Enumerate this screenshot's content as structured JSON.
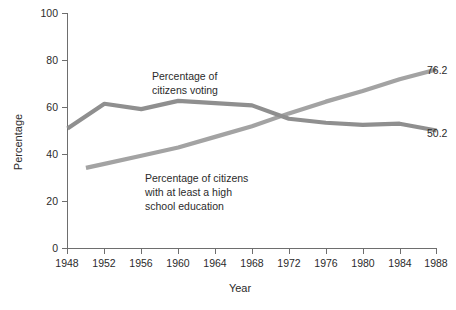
{
  "chart_data": {
    "type": "line",
    "title": "",
    "xlabel": "Year",
    "ylabel": "Percentage",
    "xlim": [
      1948,
      1988
    ],
    "ylim": [
      0,
      100
    ],
    "grid": false,
    "legend_position": "inline-annotations",
    "x_ticks": [
      "1948",
      "1952",
      "1956",
      "1960",
      "1964",
      "1968",
      "1972",
      "1976",
      "1980",
      "1984",
      "1988"
    ],
    "y_ticks": [
      "0",
      "20",
      "40",
      "60",
      "80",
      "100"
    ],
    "series": [
      {
        "name": "Percentage of citizens voting",
        "color": "#8f8f8f",
        "x": [
          1948,
          1952,
          1956,
          1960,
          1964,
          1968,
          1972,
          1976,
          1980,
          1984,
          1988
        ],
        "values": [
          51.1,
          61.6,
          59.3,
          62.8,
          61.9,
          60.9,
          55.2,
          53.5,
          52.6,
          53.1,
          50.2
        ],
        "end_label": "50.2"
      },
      {
        "name": "Percentage of citizens with at least a high school education",
        "color": "#a3a3a3",
        "x": [
          1950,
          1952,
          1956,
          1960,
          1964,
          1968,
          1972,
          1976,
          1980,
          1984,
          1988
        ],
        "values": [
          34.3,
          36.0,
          39.5,
          43.0,
          47.5,
          52.0,
          57.5,
          62.5,
          67.0,
          72.0,
          76.2
        ],
        "end_label": "76.2"
      }
    ],
    "annotations": [
      {
        "name": "voting-annotation",
        "lines": [
          "Percentage of",
          "citizens voting"
        ],
        "x": 152,
        "y": 80
      },
      {
        "name": "education-annotation",
        "lines": [
          "Percentage of citizens",
          "with at least a high",
          "school education"
        ],
        "x": 145,
        "y": 182
      }
    ]
  },
  "axis": {
    "y_label": "Percentage",
    "x_label": "Year",
    "y_tick_0": "0",
    "y_tick_20": "20",
    "y_tick_40": "40",
    "y_tick_60": "60",
    "y_tick_80": "80",
    "y_tick_100": "100",
    "x_tick_1948": "1948",
    "x_tick_1952": "1952",
    "x_tick_1956": "1956",
    "x_tick_1960": "1960",
    "x_tick_1964": "1964",
    "x_tick_1968": "1968",
    "x_tick_1972": "1972",
    "x_tick_1976": "1976",
    "x_tick_1980": "1980",
    "x_tick_1984": "1984",
    "x_tick_1988": "1988"
  },
  "labels": {
    "voting_line1": "Percentage of",
    "voting_line2": "citizens voting",
    "education_line1": "Percentage of citizens",
    "education_line2": "with at least a high",
    "education_line3": "school education",
    "end_voting": "50.2",
    "end_education": "76.2"
  },
  "colors": {
    "voting_line": "#8f8f8f",
    "education_line": "#a3a3a3",
    "axis": "#6e6e6e",
    "text": "#2b2b2b",
    "background": "#ffffff"
  }
}
